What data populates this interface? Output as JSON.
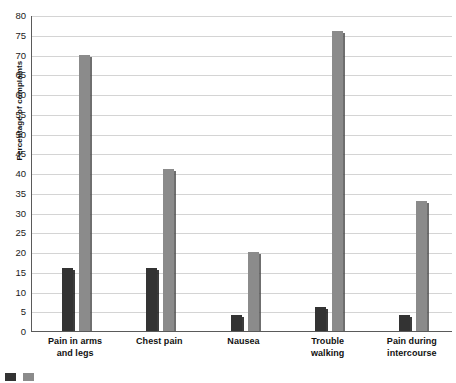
{
  "chart_data": {
    "type": "bar",
    "title": "",
    "xlabel": "",
    "ylabel": "Percentage of complaints",
    "ylim": [
      0,
      80
    ],
    "ytick_step": 5,
    "yticks": [
      80,
      75,
      70,
      65,
      60,
      55,
      50,
      45,
      40,
      35,
      30,
      25,
      20,
      15,
      10,
      5,
      0
    ],
    "grid": true,
    "legend_position": "bottom-left",
    "categories": [
      "Pain in arms and legs",
      "Chest pain",
      "Nausea",
      "Trouble walking",
      "Pain during intercourse"
    ],
    "category_lines": [
      [
        "Pain in arms",
        "and legs"
      ],
      [
        "Chest pain"
      ],
      [
        "Nausea"
      ],
      [
        "Trouble",
        "walking"
      ],
      [
        "Pain during",
        "intercourse"
      ]
    ],
    "series": [
      {
        "name": "",
        "color": "#333333",
        "values": [
          16,
          16,
          4,
          6,
          4
        ]
      },
      {
        "name": "",
        "color": "#8b8b8b",
        "values": [
          70,
          41,
          20,
          76,
          33
        ]
      }
    ]
  },
  "legend": {
    "items": [
      {
        "label": "",
        "color": "#333333"
      },
      {
        "label": "",
        "color": "#8b8b8b"
      }
    ]
  },
  "colors": {
    "series_dark": "#333333",
    "series_light": "#8b8b8b",
    "gridline": "#d4d4d4",
    "axis": "#5a5a5a",
    "text": "#111111",
    "background": "#ffffff"
  }
}
